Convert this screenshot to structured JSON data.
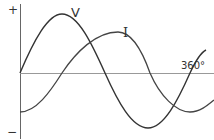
{
  "diagram": {
    "axis": {
      "plus_label": "+",
      "minus_label": "−",
      "end_label": "360°"
    },
    "curves": [
      {
        "name": "V",
        "label": "V",
        "description": "voltage waveform",
        "color": "#333333"
      },
      {
        "name": "I",
        "label": "I",
        "description": "current waveform, lagging voltage",
        "color": "#555555"
      }
    ],
    "colors": {
      "axis": "#888888",
      "curve": "#333333",
      "background": "#ffffff"
    }
  }
}
